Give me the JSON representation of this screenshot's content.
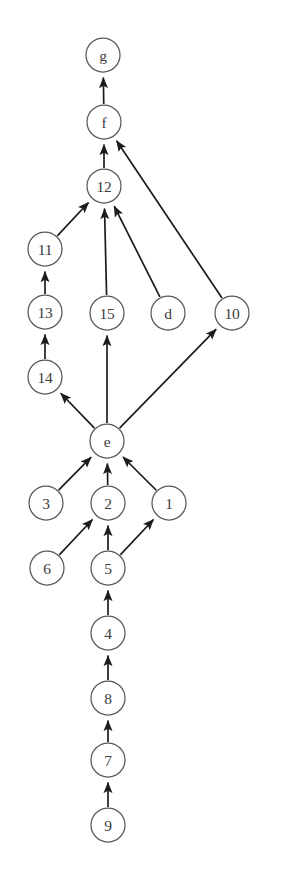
{
  "diagram": {
    "type": "directed-graph",
    "width": 284,
    "height": 872,
    "background_color": "#ffffff",
    "node_fill_color": "#ffffff",
    "node_stroke_color": "#58585a",
    "edge_color": "#1c1c1c",
    "label_color": "#3b3b3d",
    "node_radius": 17,
    "nodes": [
      {
        "id": "g",
        "label": "g",
        "x": 103,
        "y": 55
      },
      {
        "id": "f",
        "label": "f",
        "x": 104,
        "y": 122
      },
      {
        "id": "12",
        "label": "12",
        "x": 104,
        "y": 186
      },
      {
        "id": "11",
        "label": "11",
        "x": 45,
        "y": 249
      },
      {
        "id": "13",
        "label": "13",
        "x": 45,
        "y": 312
      },
      {
        "id": "15",
        "label": "15",
        "x": 107,
        "y": 313
      },
      {
        "id": "d",
        "label": "d",
        "x": 168,
        "y": 313
      },
      {
        "id": "10",
        "label": "10",
        "x": 232,
        "y": 313
      },
      {
        "id": "14",
        "label": "14",
        "x": 45,
        "y": 377
      },
      {
        "id": "e",
        "label": "e",
        "x": 107,
        "y": 441
      },
      {
        "id": "3",
        "label": "3",
        "x": 46,
        "y": 503
      },
      {
        "id": "2",
        "label": "2",
        "x": 108,
        "y": 503
      },
      {
        "id": "1",
        "label": "1",
        "x": 169,
        "y": 503
      },
      {
        "id": "6",
        "label": "6",
        "x": 47,
        "y": 568
      },
      {
        "id": "5",
        "label": "5",
        "x": 108,
        "y": 568
      },
      {
        "id": "4",
        "label": "4",
        "x": 108,
        "y": 633
      },
      {
        "id": "8",
        "label": "8",
        "x": 108,
        "y": 698
      },
      {
        "id": "7",
        "label": "7",
        "x": 108,
        "y": 760
      },
      {
        "id": "9",
        "label": "9",
        "x": 108,
        "y": 825
      }
    ],
    "edges": [
      {
        "from": "f",
        "to": "g"
      },
      {
        "from": "12",
        "to": "f"
      },
      {
        "from": "10",
        "to": "f"
      },
      {
        "from": "11",
        "to": "12"
      },
      {
        "from": "15",
        "to": "12"
      },
      {
        "from": "d",
        "to": "12"
      },
      {
        "from": "13",
        "to": "11"
      },
      {
        "from": "14",
        "to": "13"
      },
      {
        "from": "e",
        "to": "14"
      },
      {
        "from": "e",
        "to": "15"
      },
      {
        "from": "e",
        "to": "10"
      },
      {
        "from": "3",
        "to": "e"
      },
      {
        "from": "2",
        "to": "e"
      },
      {
        "from": "1",
        "to": "e"
      },
      {
        "from": "6",
        "to": "2"
      },
      {
        "from": "5",
        "to": "2"
      },
      {
        "from": "5",
        "to": "1"
      },
      {
        "from": "4",
        "to": "5"
      },
      {
        "from": "8",
        "to": "4"
      },
      {
        "from": "7",
        "to": "8"
      },
      {
        "from": "9",
        "to": "7"
      }
    ]
  }
}
